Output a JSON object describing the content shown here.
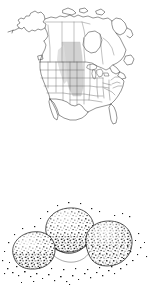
{
  "page": {
    "background_color": "#ffffff",
    "width": 151,
    "height": 287
  },
  "figures": [
    {
      "id": "range-map",
      "kind": "line-art-map",
      "name": "north-america-range-map",
      "description": "Outline map of North America with internal state and province boundaries and a shaded distribution band across the Great Plains",
      "colors": {
        "outline": "#3a3a3a",
        "internal_border": "#555555",
        "shading_fill": "#d2d2d2",
        "shading_edge": "#bcbcbc",
        "background": "#ffffff"
      },
      "regions": [
        "Alaska",
        "Yukon",
        "Northwest Territories",
        "Nunavut",
        "British Columbia",
        "Alberta",
        "Saskatchewan",
        "Manitoba",
        "Ontario",
        "Quebec",
        "Labrador",
        "Newfoundland",
        "Hudson Bay",
        "United States",
        "Baja California",
        "Mexico",
        "Florida",
        "Great Lakes"
      ],
      "shaded_range": {
        "label": "distribution band",
        "fill": "#d2d2d2",
        "covers": [
          "Saskatchewan",
          "Manitoba",
          "North Dakota",
          "South Dakota",
          "Nebraska",
          "Kansas",
          "Oklahoma"
        ]
      }
    },
    {
      "id": "tuber-illustration",
      "kind": "stipple-drawing",
      "name": "tuber-cluster-illustration",
      "description": "Pen and ink stipple illustration of three clustered rounded tubers with scattered dot texture",
      "colors": {
        "ink": "#1a1a1a",
        "outline": "#2b2b2b",
        "background": "#ffffff"
      },
      "subjects": [
        {
          "name": "tuber-left",
          "position": "lower left"
        },
        {
          "name": "tuber-top",
          "position": "upper center"
        },
        {
          "name": "tuber-right",
          "position": "right"
        }
      ],
      "stipple": {
        "density": "heavy",
        "scatter": "dots spill outward beyond outlines"
      }
    }
  ]
}
